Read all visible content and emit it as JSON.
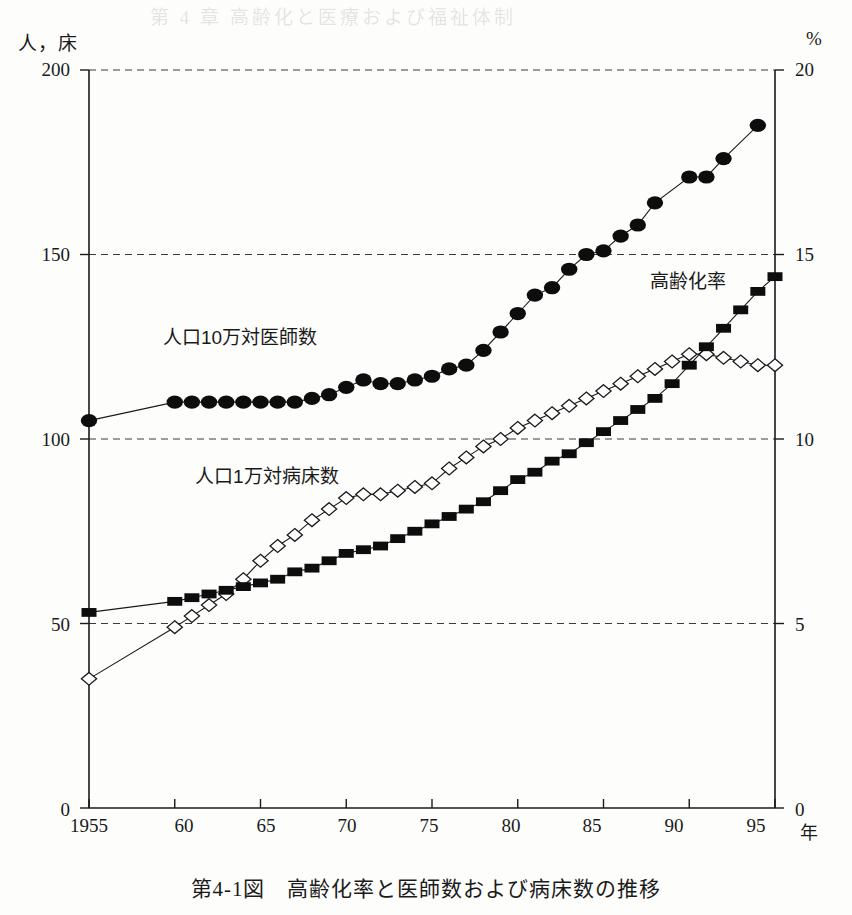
{
  "figure": {
    "caption": "第4-1図　高齢化率と医師数および病床数の推移",
    "bleed_text": "第 4 章  高齢化と医療および福祉体制"
  },
  "axes": {
    "left_unit": "人，床",
    "right_unit": "%",
    "x_unit": "年",
    "left_ticks": [
      "200",
      "150",
      "100",
      "50",
      "0"
    ],
    "right_ticks": [
      "20",
      "15",
      "10",
      "5",
      "0"
    ],
    "x_ticks": [
      "1955",
      "60",
      "65",
      "70",
      "75",
      "80",
      "85",
      "90",
      "95"
    ]
  },
  "annotations": {
    "doctors": "人口10万対医師数",
    "beds": "人口1万対病床数",
    "aging": "高齢化率"
  },
  "chart_data": {
    "type": "line",
    "title": "第4-1図　高齢化率と医師数および病床数の推移",
    "xlabel": "年",
    "ylabel_left": "人，床",
    "ylabel_right": "%",
    "xlim": [
      1955,
      1995
    ],
    "ylim_left": [
      0,
      200
    ],
    "ylim_right": [
      0,
      20
    ],
    "grid": "horizontal-dashed",
    "legend": "inline-annotations",
    "series": [
      {
        "name": "人口10万対医師数",
        "axis": "left",
        "marker": "filled-circle",
        "color": "#000000",
        "x": [
          1955,
          1960,
          1961,
          1962,
          1963,
          1964,
          1965,
          1966,
          1967,
          1968,
          1969,
          1970,
          1971,
          1972,
          1973,
          1974,
          1975,
          1976,
          1977,
          1978,
          1979,
          1980,
          1981,
          1982,
          1983,
          1984,
          1985,
          1986,
          1987,
          1988,
          1990,
          1991,
          1992,
          1994
        ],
        "y": [
          105,
          110,
          110,
          110,
          110,
          110,
          110,
          110,
          110,
          111,
          112,
          114,
          116,
          115,
          115,
          116,
          117,
          119,
          120,
          124,
          129,
          134,
          139,
          141,
          146,
          150,
          151,
          155,
          158,
          164,
          171,
          171,
          176,
          185
        ]
      },
      {
        "name": "人口1万対病床数",
        "axis": "left",
        "marker": "open-diamond",
        "color": "#000000",
        "x": [
          1955,
          1960,
          1961,
          1962,
          1963,
          1964,
          1965,
          1966,
          1967,
          1968,
          1969,
          1970,
          1971,
          1972,
          1973,
          1974,
          1975,
          1976,
          1977,
          1978,
          1979,
          1980,
          1981,
          1982,
          1983,
          1984,
          1985,
          1986,
          1987,
          1988,
          1989,
          1990,
          1991,
          1992,
          1993,
          1994,
          1995
        ],
        "y": [
          35,
          49,
          52,
          55,
          58,
          62,
          67,
          71,
          74,
          78,
          81,
          84,
          85,
          85,
          86,
          87,
          88,
          92,
          95,
          98,
          100,
          103,
          105,
          107,
          109,
          111,
          113,
          115,
          117,
          119,
          121,
          123,
          123,
          122,
          121,
          120,
          120
        ]
      },
      {
        "name": "高齢化率",
        "axis": "right",
        "marker": "filled-square",
        "color": "#000000",
        "x": [
          1955,
          1960,
          1961,
          1962,
          1963,
          1964,
          1965,
          1966,
          1967,
          1968,
          1969,
          1970,
          1971,
          1972,
          1973,
          1974,
          1975,
          1976,
          1977,
          1978,
          1979,
          1980,
          1981,
          1982,
          1983,
          1984,
          1985,
          1986,
          1987,
          1988,
          1989,
          1990,
          1991,
          1992,
          1993,
          1994,
          1995
        ],
        "y": [
          5.3,
          5.6,
          5.7,
          5.8,
          5.9,
          6.0,
          6.1,
          6.2,
          6.4,
          6.5,
          6.7,
          6.9,
          7.0,
          7.1,
          7.3,
          7.5,
          7.7,
          7.9,
          8.1,
          8.3,
          8.6,
          8.9,
          9.1,
          9.4,
          9.6,
          9.9,
          10.2,
          10.5,
          10.8,
          11.1,
          11.5,
          12.0,
          12.5,
          13.0,
          13.5,
          14.0,
          14.4
        ]
      }
    ]
  }
}
